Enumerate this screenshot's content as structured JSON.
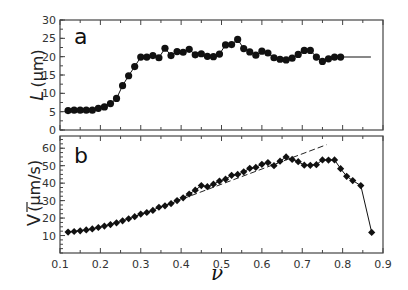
{
  "figure": {
    "panel_a_label": "a",
    "panel_b_label": "b",
    "ylabel_a_italic": "L",
    "ylabel_a_unit": "(µm)",
    "ylabel_b_symbol": "V",
    "ylabel_b_unit": "(µm/s)",
    "xlabel": "ν"
  },
  "chart_data": [
    {
      "type": "line",
      "panel": "a",
      "title": "",
      "xlabel": "ν",
      "ylabel": "L (µm)",
      "xlim": [
        0.1,
        0.9
      ],
      "ylim": [
        0,
        30
      ],
      "xticks": [
        0.1,
        0.2,
        0.3,
        0.4,
        0.5,
        0.6,
        0.7,
        0.8,
        0.9
      ],
      "yticks": [
        0,
        5,
        10,
        15,
        20,
        25,
        30
      ],
      "marker": "circle",
      "grid": false,
      "x": [
        0.12,
        0.135,
        0.15,
        0.165,
        0.18,
        0.195,
        0.21,
        0.225,
        0.24,
        0.255,
        0.27,
        0.285,
        0.3,
        0.315,
        0.33,
        0.345,
        0.36,
        0.375,
        0.39,
        0.405,
        0.42,
        0.435,
        0.45,
        0.465,
        0.48,
        0.495,
        0.51,
        0.525,
        0.54,
        0.555,
        0.57,
        0.585,
        0.6,
        0.615,
        0.63,
        0.645,
        0.66,
        0.675,
        0.69,
        0.705,
        0.72,
        0.735,
        0.75,
        0.765,
        0.78,
        0.795,
        0.81,
        0.825,
        0.84,
        0.855
      ],
      "values": [
        5.3,
        5.4,
        5.4,
        5.4,
        5.4,
        5.9,
        6.3,
        7.2,
        8.6,
        12.1,
        14.8,
        17.3,
        19.9,
        19.9,
        20.3,
        19.7,
        22.3,
        20.3,
        21.4,
        21.2,
        22.0,
        20.5,
        20.8,
        20.1,
        20.0,
        20.7,
        23.2,
        23.3,
        24.7,
        22.2,
        21.3,
        20.4,
        21.5,
        21.0,
        19.7,
        19.3,
        19.1,
        19.6,
        20.6,
        21.7,
        21.7,
        19.9,
        18.7,
        19.4,
        19.9,
        19.9,
        19.9,
        19.9,
        19.9,
        19.9
      ],
      "line_end": [
        0.87,
        19.9
      ]
    },
    {
      "type": "line",
      "panel": "b",
      "title": "",
      "xlabel": "ν",
      "ylabel": "V̄ (µm/s)",
      "xlim": [
        0.1,
        0.9
      ],
      "ylim": [
        0,
        65
      ],
      "xticks": [
        0.1,
        0.2,
        0.3,
        0.4,
        0.5,
        0.6,
        0.7,
        0.8,
        0.9
      ],
      "yticks": [
        10,
        20,
        30,
        40,
        50,
        60
      ],
      "marker": "diamond",
      "grid": false,
      "x": [
        0.12,
        0.135,
        0.15,
        0.165,
        0.18,
        0.195,
        0.21,
        0.225,
        0.24,
        0.255,
        0.27,
        0.285,
        0.3,
        0.315,
        0.33,
        0.345,
        0.36,
        0.375,
        0.39,
        0.405,
        0.42,
        0.435,
        0.45,
        0.465,
        0.48,
        0.495,
        0.51,
        0.525,
        0.54,
        0.555,
        0.57,
        0.585,
        0.6,
        0.615,
        0.63,
        0.645,
        0.66,
        0.675,
        0.69,
        0.705,
        0.72,
        0.735,
        0.75,
        0.765,
        0.78,
        0.795,
        0.81,
        0.825,
        0.84,
        0.855,
        0.87
      ],
      "values": [
        12.0,
        12.3,
        12.7,
        13.2,
        13.8,
        14.6,
        15.4,
        16.3,
        17.3,
        18.4,
        19.6,
        20.8,
        22.3,
        23.2,
        24.4,
        26.2,
        27.0,
        28.3,
        30.0,
        31.6,
        33.8,
        36.0,
        38.6,
        38.0,
        39.4,
        41.2,
        42.3,
        44.5,
        45.0,
        46.5,
        48.5,
        49.0,
        50.8,
        51.8,
        51.2,
        52.6,
        55.0,
        53.6,
        52.3,
        50.3,
        50.2,
        50.6,
        53.3,
        53.2,
        53.3,
        48.3,
        43.9,
        41.8,
        38.8,
        12.0,
        12.0
      ],
      "series": [
        {
          "name": "data",
          "x": [
            0.12,
            0.135,
            0.15,
            0.165,
            0.18,
            0.195,
            0.21,
            0.225,
            0.24,
            0.255,
            0.27,
            0.285,
            0.3,
            0.315,
            0.33,
            0.345,
            0.36,
            0.375,
            0.39,
            0.405,
            0.42,
            0.435,
            0.45,
            0.465,
            0.48,
            0.495,
            0.51,
            0.525,
            0.54,
            0.555,
            0.57,
            0.585,
            0.6,
            0.615,
            0.63,
            0.645,
            0.66,
            0.675,
            0.69,
            0.705,
            0.72,
            0.735,
            0.75,
            0.765,
            0.78,
            0.795,
            0.81,
            0.825,
            0.845,
            0.872
          ],
          "values": [
            12.0,
            12.3,
            12.7,
            13.2,
            13.8,
            14.6,
            15.4,
            16.3,
            17.3,
            18.4,
            19.6,
            20.8,
            22.3,
            23.2,
            24.4,
            26.2,
            27.0,
            28.3,
            30.0,
            31.6,
            33.8,
            36.0,
            38.6,
            38.0,
            39.4,
            41.2,
            42.3,
            44.5,
            45.0,
            46.5,
            48.5,
            49.0,
            50.8,
            51.8,
            50.0,
            52.6,
            55.0,
            53.6,
            52.3,
            50.3,
            50.2,
            50.6,
            53.3,
            53.2,
            53.3,
            48.3,
            43.9,
            41.5,
            38.6,
            11.8
          ]
        },
        {
          "name": "linear fit (dashed)",
          "x": [
            0.3,
            0.76
          ],
          "values": [
            22.0,
            62.0
          ]
        }
      ]
    }
  ]
}
